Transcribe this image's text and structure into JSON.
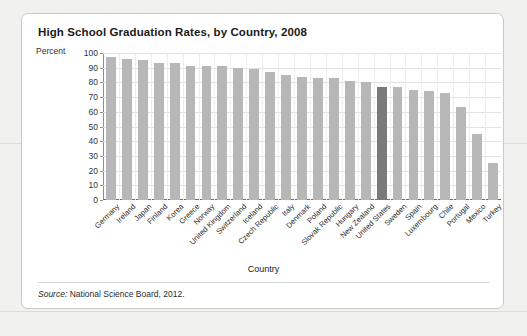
{
  "card": {
    "title": "High School Graduation Rates, by Country, 2008",
    "y_axis_label": "Percent",
    "x_axis_title": "Country",
    "source_keyword": "Source:",
    "source_text": "National Science Board, 2012."
  },
  "colors": {
    "bar": "#b7b7b7",
    "bar_highlight": "#7a7a7a",
    "card_background": "#ffffff",
    "page_background": "#f1f1ef",
    "grid": "#e2e2e2",
    "axis": "#8d8d8d",
    "text": "#1c1c1c"
  },
  "chart_data": {
    "type": "bar",
    "title": "High School Graduation Rates, by Country, 2008",
    "xlabel": "Country",
    "ylabel": "Percent",
    "ylim": [
      0,
      100
    ],
    "yticks": [
      0,
      10,
      20,
      30,
      40,
      50,
      60,
      70,
      80,
      90,
      100
    ],
    "grid": true,
    "legend": false,
    "highlight_category": "United States",
    "categories": [
      "Germany",
      "Ireland",
      "Japan",
      "Finland",
      "Korea",
      "Greece",
      "Norway",
      "United Kingdom",
      "Switzerland",
      "Iceland",
      "Czech Republic",
      "Italy",
      "Denmark",
      "Poland",
      "Slovak Republic",
      "Hungary",
      "New Zealand",
      "United States",
      "Sweden",
      "Spain",
      "Luxembourg",
      "Chile",
      "Portugal",
      "Mexico",
      "Turkey"
    ],
    "values": [
      97,
      96,
      95,
      93,
      93,
      91,
      91,
      91,
      90,
      89,
      87,
      85,
      84,
      83,
      83,
      81,
      80,
      77,
      77,
      75,
      74,
      73,
      63,
      45,
      25
    ]
  }
}
